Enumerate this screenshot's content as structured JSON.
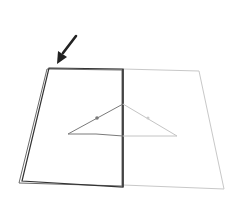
{
  "diagram": {
    "description": "Paper folding illustration: open sheet with left half folded, triangle drawn across the center fold, arrow pointing at top-left corner",
    "colors": {
      "background": "#ffffff",
      "front_edge": "#333333",
      "back_edge": "#bdbdbd",
      "triangle_left": "#7a7a7a",
      "triangle_right": "#c4c4c4",
      "arrow": "#222222"
    },
    "elements": {
      "arrow": "arrow-pointing-to-corner",
      "left_page": "folded-left-page",
      "right_page": "right-page",
      "fold_line": "center-fold",
      "triangle": "triangle-across-fold",
      "marker_left": "dot-marker-left",
      "marker_right": "dot-marker-right"
    }
  }
}
